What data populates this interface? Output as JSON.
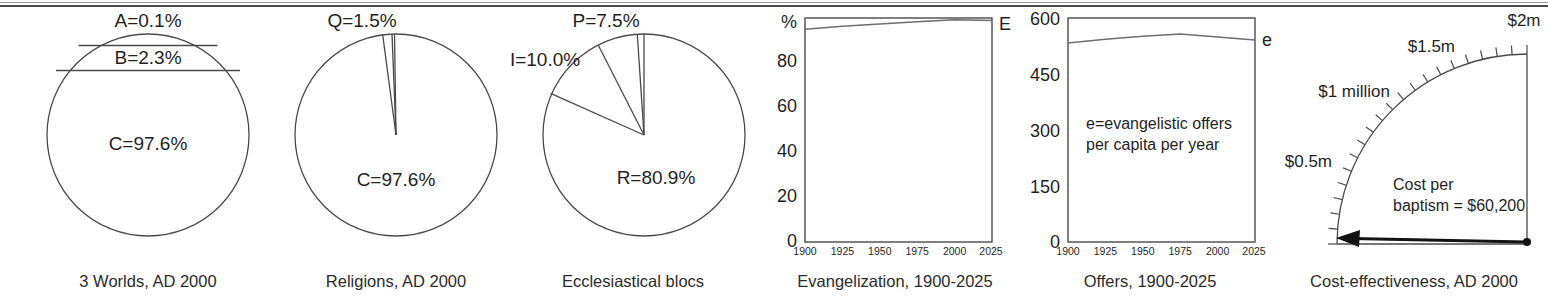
{
  "figure": {
    "top_rule": true,
    "panel_count": 6,
    "ink_color": "#1f1f1f",
    "line_color": "#4a4a4a"
  },
  "panels": [
    {
      "id": "three-worlds",
      "caption": "3 Worlds, AD 2000",
      "chart_data": {
        "type": "pie",
        "title": "3 Worlds, AD 2000",
        "orientation": "horizontal-bands",
        "labels": [
          "A=0.1%",
          "B=2.3%",
          "C=97.6%"
        ],
        "categories": [
          "A",
          "B",
          "C"
        ],
        "values": [
          0.1,
          2.3,
          97.6
        ],
        "unit": "%"
      }
    },
    {
      "id": "religions",
      "caption": "Religions, AD 2000",
      "chart_data": {
        "type": "pie",
        "title": "Religions, AD 2000",
        "labels": [
          "Q=1.5%",
          "C=97.6%"
        ],
        "categories": [
          "Q",
          "C"
        ],
        "values": [
          1.5,
          97.6
        ],
        "unit": "%"
      }
    },
    {
      "id": "ecclesiastical-blocs",
      "caption": "Ecclesiastical blocs",
      "chart_data": {
        "type": "pie",
        "title": "Ecclesiastical blocs",
        "labels": [
          "P=7.5%",
          "I=10.0%",
          "R=80.9%"
        ],
        "categories": [
          "P",
          "I",
          "R"
        ],
        "values": [
          7.5,
          10.0,
          80.9
        ],
        "unit": "%"
      }
    },
    {
      "id": "evangelization",
      "caption": "Evangelization, 1900-2025",
      "chart_data": {
        "type": "line",
        "title": "Evangelization, 1900-2025",
        "ylabel": "%",
        "xlabel": "",
        "series_label": "E",
        "ylim": [
          0,
          100
        ],
        "yticks": [
          "0",
          "20",
          "40",
          "60",
          "80"
        ],
        "ytick_values": [
          0,
          20,
          40,
          60,
          80
        ],
        "xlim": [
          1900,
          2025
        ],
        "xticks": [
          "1900",
          "1925",
          "1950",
          "1975",
          "2000",
          "2025"
        ],
        "xtick_values": [
          1900,
          1925,
          1950,
          1975,
          2000,
          2025
        ],
        "x": [
          1900,
          1925,
          1950,
          1975,
          2000,
          2025
        ],
        "values": [
          95.0,
          96.3,
          97.3,
          98.3,
          99.2,
          98.9
        ],
        "grid": false
      }
    },
    {
      "id": "offers",
      "caption": "Offers, 1900-2025",
      "chart_data": {
        "type": "line",
        "title": "Offers, 1900-2025",
        "ylabel": "",
        "xlabel": "",
        "series_label": "e",
        "annotation": "e=evangelistic offers\nper capita per year",
        "annotation_lines": [
          "e=evangelistic offers",
          "per capita per year"
        ],
        "ylim": [
          0,
          600
        ],
        "yticks": [
          "0",
          "150",
          "300",
          "450",
          "600"
        ],
        "ytick_values": [
          0,
          150,
          300,
          450,
          600
        ],
        "xlim": [
          1900,
          2025
        ],
        "xticks": [
          "1900",
          "1925",
          "1950",
          "1975",
          "2000",
          "2025"
        ],
        "xtick_values": [
          1900,
          1925,
          1950,
          1975,
          2000,
          2025
        ],
        "x": [
          1900,
          1925,
          1950,
          1975,
          2000,
          2025
        ],
        "values": [
          533,
          543,
          551,
          557,
          549,
          541
        ],
        "grid": false
      }
    },
    {
      "id": "cost-effectiveness",
      "caption": "Cost-effectiveness, AD 2000",
      "chart_data": {
        "type": "gauge",
        "title": "Cost-effectiveness, AD 2000",
        "scale_labels": [
          "$0.5m",
          "$1 million",
          "$1.5m",
          "$2m"
        ],
        "scale_values": [
          500000,
          1000000,
          1500000,
          2000000
        ],
        "range_min": 0,
        "range_max": 2000000,
        "needle_value": 60200,
        "readout_lines": [
          "Cost per",
          "baptism = $60,200"
        ],
        "readout": "Cost per baptism = $60,200",
        "tick_count": 20
      }
    }
  ]
}
